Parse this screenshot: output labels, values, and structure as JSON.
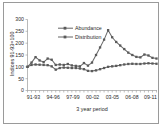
{
  "chart_data": {
    "type": "line",
    "title": "",
    "xlabel": "3 year period",
    "ylabel": "Indices 91-93=100",
    "ylim": [
      0,
      300
    ],
    "ytick_labels": [
      "0",
      "50",
      "100",
      "150",
      "200",
      "250",
      "300"
    ],
    "ytick_values": [
      0,
      50,
      100,
      150,
      200,
      250,
      300
    ],
    "grid": false,
    "legend_position": "top-center",
    "x_tick_labels": [
      "91-93",
      "94-96",
      "97-99",
      "00-02",
      "03-05",
      "06-08",
      "09-11"
    ],
    "x_tick_indices": [
      0,
      3,
      6,
      9,
      12,
      15,
      18
    ],
    "x": [
      0,
      1,
      2,
      3,
      4,
      5,
      6,
      7,
      8,
      9,
      10,
      11,
      12,
      13,
      14,
      15,
      16,
      17,
      18,
      19,
      20
    ],
    "series": [
      {
        "name": "Abundance",
        "color": "#6b6b6b",
        "values": [
          100,
          118,
          141,
          127,
          120,
          135,
          130,
          108,
          110,
          108,
          112,
          106,
          104,
          102,
          116,
          105,
          118,
          150,
          182,
          215,
          255
        ]
      },
      {
        "name": "Distribution",
        "color": "#6b6b6b",
        "values": [
          100,
          108,
          110,
          109,
          108,
          107,
          102,
          88,
          95,
          97,
          96,
          95,
          95,
          93,
          90,
          83,
          82,
          85,
          90,
          95,
          100
        ]
      }
    ],
    "series_tail": [
      {
        "name": "Abundance",
        "values": [
          255,
          225,
          205,
          190,
          175,
          160,
          150,
          142,
          140,
          152,
          148,
          138,
          135
        ]
      },
      {
        "name": "Distribution",
        "values": [
          100,
          102,
          104,
          107,
          110,
          112,
          113,
          112,
          112,
          114,
          115,
          114,
          113
        ]
      }
    ]
  },
  "legend": {
    "entries": [
      {
        "label": "Abundance"
      },
      {
        "label": "Distribution"
      }
    ]
  },
  "axes": {
    "y_title": "Indices 91-93=100",
    "x_title": "3 year period"
  }
}
